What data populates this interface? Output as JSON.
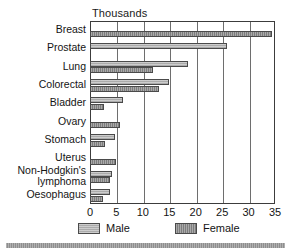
{
  "chart_data": {
    "type": "bar",
    "orientation": "horizontal",
    "title": "Thousands",
    "xlabel": "",
    "ylabel": "",
    "xlim": [
      0,
      35
    ],
    "xticks": [
      0,
      5,
      10,
      15,
      20,
      25,
      30,
      35
    ],
    "grid": true,
    "grid_axis": "x",
    "legend_position": "bottom",
    "categories": [
      "Breast",
      "Prostate",
      "Lung",
      "Colorectal",
      "Bladder",
      "Ovary",
      "Stomach",
      "Uterus",
      "Non-Hodgkin's lymphoma",
      "Oesophagus"
    ],
    "category_label_lines": [
      [
        "Breast"
      ],
      [
        "Prostate"
      ],
      [
        "Lung"
      ],
      [
        "Colorectal"
      ],
      [
        "Bladder"
      ],
      [
        "Ovary"
      ],
      [
        "Stomach"
      ],
      [
        "Uterus"
      ],
      [
        "Non-Hodgkin's",
        "lymphoma"
      ],
      [
        "Oesophagus"
      ]
    ],
    "series": [
      {
        "name": "Male",
        "color": "#ababab",
        "values": [
          null,
          26.0,
          18.5,
          15.0,
          6.3,
          null,
          4.8,
          null,
          4.2,
          3.8
        ]
      },
      {
        "name": "Female",
        "color": "#7d7d7d",
        "values": [
          34.5,
          null,
          12.0,
          13.0,
          2.7,
          5.7,
          2.9,
          4.9,
          3.8,
          2.5
        ]
      }
    ]
  },
  "legend": {
    "items": [
      {
        "label": "Male",
        "swatch": "male"
      },
      {
        "label": "Female",
        "swatch": "female"
      }
    ]
  },
  "colors": {
    "male_bar": "#ababab",
    "female_bar": "#7d7d7d",
    "frame": "#3c3c3c",
    "gridline": "#6e6e6e",
    "text": "#141414",
    "bottom_rule": "#8e8e8e",
    "background": "#ffffff"
  }
}
